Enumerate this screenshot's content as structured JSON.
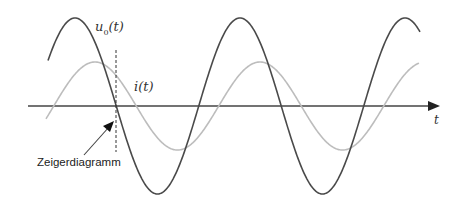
{
  "diagram": {
    "axis": {
      "label": "t",
      "y_px": 106,
      "x_start_px": 28,
      "x_end_px": 438
    },
    "curves": [
      {
        "name": "u0",
        "label_main": "u",
        "label_sub": "0",
        "label_arg": "(t)",
        "color": "#4a4a4a",
        "amplitude_px": 88,
        "period_px": 165,
        "phase_peak_x_px": 75,
        "x_start_px": 48,
        "x_end_px": 420
      },
      {
        "name": "i",
        "label_main": "i",
        "label_arg": "(t)",
        "color": "#bdbdbd",
        "amplitude_px": 44,
        "period_px": 165,
        "phase_peak_x_px": 95,
        "x_start_px": 46,
        "x_end_px": 419
      }
    ],
    "marker": {
      "label": "Zeigerdiagramm",
      "x_px": 116
    },
    "colors": {
      "axis": "#333333",
      "u0": "#4a4a4a",
      "i": "#bdbdbd",
      "dashed": "#333333"
    }
  }
}
